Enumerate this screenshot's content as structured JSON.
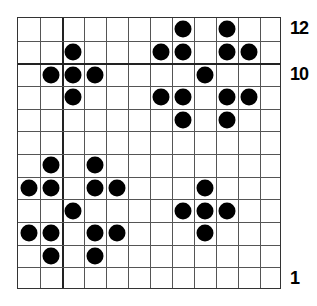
{
  "grid": {
    "columns": 12,
    "rows": 12,
    "thick_vertical_after_column": 2,
    "thick_horizontal_between_rows": [
      11,
      10
    ]
  },
  "row_labels": [
    {
      "row": 12,
      "text": "12"
    },
    {
      "row": 10,
      "text": "10"
    },
    {
      "row": 1,
      "text": "1"
    }
  ],
  "pieces": [
    {
      "row": 12,
      "col": 8
    },
    {
      "row": 12,
      "col": 10
    },
    {
      "row": 11,
      "col": 3
    },
    {
      "row": 11,
      "col": 7
    },
    {
      "row": 11,
      "col": 8
    },
    {
      "row": 11,
      "col": 10
    },
    {
      "row": 11,
      "col": 11
    },
    {
      "row": 10,
      "col": 2
    },
    {
      "row": 10,
      "col": 3
    },
    {
      "row": 10,
      "col": 4
    },
    {
      "row": 10,
      "col": 9
    },
    {
      "row": 9,
      "col": 3
    },
    {
      "row": 9,
      "col": 7
    },
    {
      "row": 9,
      "col": 8
    },
    {
      "row": 9,
      "col": 10
    },
    {
      "row": 9,
      "col": 11
    },
    {
      "row": 8,
      "col": 8
    },
    {
      "row": 8,
      "col": 10
    },
    {
      "row": 6,
      "col": 2
    },
    {
      "row": 6,
      "col": 4
    },
    {
      "row": 5,
      "col": 1
    },
    {
      "row": 5,
      "col": 2
    },
    {
      "row": 5,
      "col": 4
    },
    {
      "row": 5,
      "col": 5
    },
    {
      "row": 5,
      "col": 9
    },
    {
      "row": 4,
      "col": 3
    },
    {
      "row": 4,
      "col": 8
    },
    {
      "row": 4,
      "col": 9
    },
    {
      "row": 4,
      "col": 10
    },
    {
      "row": 3,
      "col": 1
    },
    {
      "row": 3,
      "col": 2
    },
    {
      "row": 3,
      "col": 4
    },
    {
      "row": 3,
      "col": 5
    },
    {
      "row": 3,
      "col": 9
    },
    {
      "row": 2,
      "col": 2
    },
    {
      "row": 2,
      "col": 4
    }
  ],
  "colors": {
    "piece": "#000000",
    "grid_line": "#555555",
    "background": "#ffffff"
  }
}
